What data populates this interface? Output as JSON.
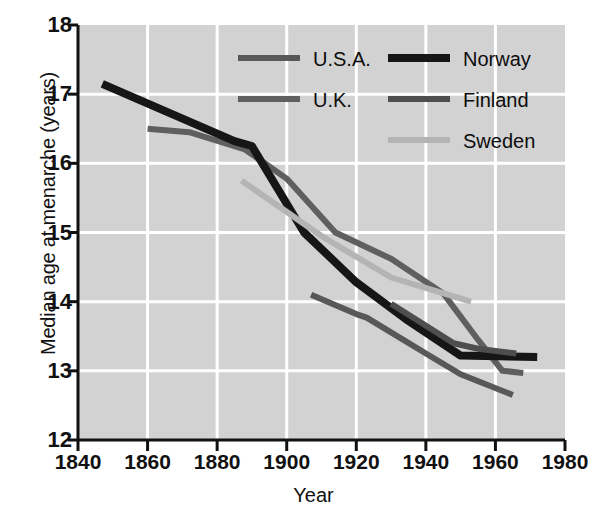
{
  "chart_data": {
    "type": "line",
    "title": "",
    "xlabel": "Year",
    "ylabel": "Median age at menarche (years)",
    "xlim": [
      1840,
      1980
    ],
    "ylim": [
      12,
      18
    ],
    "xticks": [
      1840,
      1860,
      1880,
      1900,
      1920,
      1940,
      1960,
      1980
    ],
    "yticks": [
      12,
      13,
      14,
      15,
      16,
      17,
      18
    ],
    "grid": true,
    "grid_color": "#ffffff",
    "plot_background": "#d2d2d2",
    "legend_position": "top-right",
    "series": [
      {
        "name": "U.S.A.",
        "color": "#585858",
        "width": 6,
        "points": [
          [
            1907,
            14.1
          ],
          [
            1920,
            13.82
          ],
          [
            1923,
            13.77
          ],
          [
            1940,
            13.25
          ],
          [
            1950,
            12.95
          ],
          [
            1965,
            12.65
          ]
        ]
      },
      {
        "name": "U.K.",
        "color": "#5f5f5f",
        "width": 6,
        "points": [
          [
            1860,
            16.5
          ],
          [
            1872,
            16.45
          ],
          [
            1888,
            16.2
          ],
          [
            1900,
            15.78
          ],
          [
            1914,
            15.0
          ],
          [
            1930,
            14.62
          ],
          [
            1945,
            14.12
          ],
          [
            1955,
            13.45
          ],
          [
            1962,
            13.0
          ],
          [
            1968,
            12.97
          ]
        ]
      },
      {
        "name": "Norway",
        "color": "#161616",
        "width": 8,
        "points": [
          [
            1847,
            17.15
          ],
          [
            1885,
            16.32
          ],
          [
            1890,
            16.25
          ],
          [
            1905,
            15.0
          ],
          [
            1920,
            14.28
          ],
          [
            1935,
            13.72
          ],
          [
            1950,
            13.22
          ],
          [
            1972,
            13.2
          ]
        ]
      },
      {
        "name": "Finland",
        "color": "#4e4e4e",
        "width": 6,
        "points": [
          [
            1930,
            13.97
          ],
          [
            1948,
            13.4
          ],
          [
            1955,
            13.32
          ],
          [
            1966,
            13.25
          ]
        ]
      },
      {
        "name": "Sweden",
        "color": "#b4b4b4",
        "width": 6,
        "points": [
          [
            1887,
            15.75
          ],
          [
            1910,
            14.95
          ],
          [
            1930,
            14.35
          ],
          [
            1953,
            14.0
          ]
        ]
      }
    ],
    "legend_entries": [
      {
        "label": "U.S.A.",
        "color": "#585858",
        "width": 6
      },
      {
        "label": "U.K.",
        "color": "#5f5f5f",
        "width": 6
      },
      {
        "label": "Norway",
        "color": "#161616",
        "width": 8
      },
      {
        "label": "Finland",
        "color": "#4e4e4e",
        "width": 6
      },
      {
        "label": "Sweden",
        "color": "#b4b4b4",
        "width": 6
      }
    ]
  }
}
